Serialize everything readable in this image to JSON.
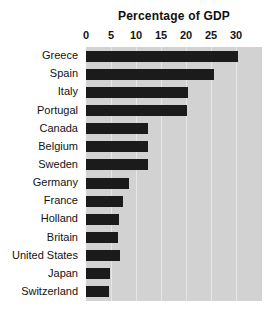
{
  "chart_data": {
    "type": "bar",
    "orientation": "horizontal",
    "title": "Percentage of GDP",
    "xlabel": "",
    "ylabel": "",
    "xlim": [
      0,
      35.2
    ],
    "xticks": [
      0,
      5,
      10,
      15,
      20,
      25,
      30
    ],
    "xtick_labels": [
      "0",
      "5",
      "10",
      "15",
      "20",
      "25",
      "30"
    ],
    "grid": true,
    "grid_axis": "x",
    "legend": null,
    "categories": [
      "Greece",
      "Spain",
      "Italy",
      "Portugal",
      "Canada",
      "Belgium",
      "Sweden",
      "Germany",
      "France",
      "Holland",
      "Britain",
      "United States",
      "Japan",
      "Switzerland"
    ],
    "values": [
      30.4,
      25.5,
      20.4,
      20.2,
      12.4,
      12.4,
      12.4,
      8.6,
      7.4,
      6.6,
      6.4,
      6.8,
      4.8,
      4.6
    ],
    "bar_color": "#1b1b1b",
    "plot_background": "#d2d2d2",
    "figure_background": "#ffffff"
  }
}
